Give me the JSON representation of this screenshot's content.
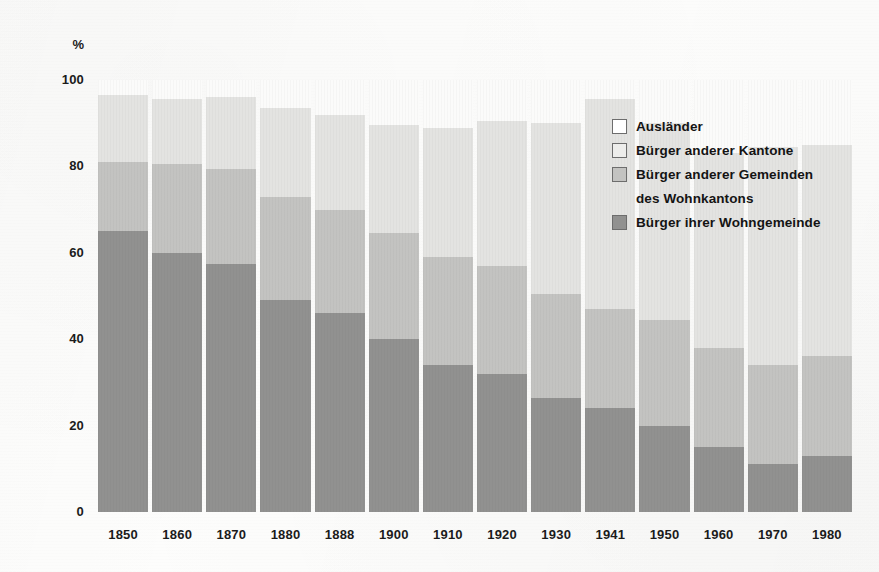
{
  "axes": {
    "y_unit_label": "%",
    "y_ticks": [
      "100",
      "80",
      "60",
      "40",
      "20",
      "0"
    ],
    "y_tick_values": [
      100,
      80,
      60,
      40,
      20,
      0
    ],
    "ylim": [
      0,
      100
    ]
  },
  "legend": {
    "entries": [
      {
        "label": "Ausländer",
        "swatch": "auslaender",
        "color": "#ffffff"
      },
      {
        "label": "Bürger anderer Kantone",
        "swatch": "kantone",
        "color": "#ededeb"
      },
      {
        "label": "Bürger anderer Gemeinden",
        "swatch": "gemeinden",
        "color": "#c3c3c1"
      },
      {
        "label": "des Wohnkantons",
        "swatch": "none",
        "color": ""
      },
      {
        "label": "Bürger ihrer Wohngemeinde",
        "swatch": "wohn",
        "color": "#919190"
      }
    ]
  },
  "chart_data": {
    "type": "bar",
    "stacked": true,
    "title": "",
    "xlabel": "",
    "ylabel": "%",
    "ylim": [
      0,
      100
    ],
    "grid": false,
    "legend_position": "inside-top-right",
    "categories": [
      "1850",
      "1860",
      "1870",
      "1880",
      "1888",
      "1900",
      "1910",
      "1920",
      "1930",
      "1941",
      "1950",
      "1960",
      "1970",
      "1980"
    ],
    "series": [
      {
        "name": "Bürger ihrer Wohngemeinde",
        "color": "#919190",
        "values": [
          65,
          60,
          57.5,
          49,
          46,
          40,
          34,
          32,
          26.5,
          24,
          20,
          15,
          11,
          13
        ]
      },
      {
        "name": "Bürger anderer Gemeinden des Wohnkantons",
        "color": "#c3c3c1",
        "values": [
          16,
          20.5,
          22,
          24,
          24,
          24.5,
          25,
          25,
          24,
          23,
          24.5,
          23,
          23,
          23
        ]
      },
      {
        "name": "Bürger anderer Kantone",
        "color": "#e3e3e1",
        "values": [
          15.5,
          15,
          16.5,
          20.5,
          22,
          25,
          30,
          33.5,
          39.5,
          48.5,
          45.5,
          45,
          50.5,
          49
        ]
      },
      {
        "name": "Ausländer",
        "color": "#fbfbfa",
        "values": [
          3.5,
          4.5,
          4,
          6.5,
          8,
          10.5,
          11,
          9.5,
          10,
          4.5,
          10,
          17,
          15.5,
          15
        ]
      }
    ],
    "cumulative_tops": {
      "note": "running totals per category, bottom-to-top",
      "Bürger ihrer Wohngemeinde": [
        65,
        60,
        57.5,
        49,
        46,
        40,
        34,
        32,
        26.5,
        24,
        20,
        15,
        11,
        13
      ],
      "Bürger anderer Gemeinden des Wohnkantons": [
        81,
        80.5,
        79.5,
        73,
        70,
        64.5,
        59,
        57,
        50.5,
        47,
        44.5,
        38,
        34,
        36
      ],
      "Bürger anderer Kantone": [
        96.5,
        95.5,
        96,
        93.5,
        92,
        89.5,
        89,
        90.5,
        90,
        95.5,
        90,
        83,
        84.5,
        85
      ],
      "Ausländer": [
        100,
        100,
        100,
        100,
        100,
        100,
        100,
        100,
        100,
        100,
        100,
        100,
        100,
        100
      ]
    }
  },
  "colors": {
    "auslaender": "#fbfbfa",
    "kantone": "#e3e3e1",
    "gemeinden": "#c3c3c1",
    "wohngemeinde": "#919190",
    "text": "#1b1b1b",
    "page": "#fdfdfc"
  }
}
